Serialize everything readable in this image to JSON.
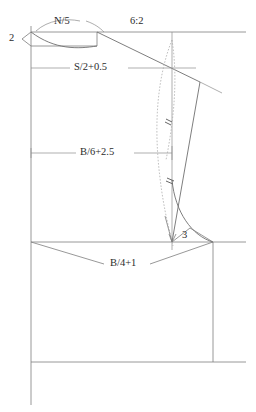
{
  "drawing": {
    "title": "Bodice block pattern draft",
    "type": "technical-line-drawing",
    "colors": {
      "background": "#ffffff",
      "line": "#6b6b6b",
      "construction_line": "#9a9a9a",
      "dashed_curve": "#a8a8a8",
      "text": "#2b2b2b"
    },
    "labels": [
      {
        "id": "neck-width",
        "text": "N/5",
        "x": 54,
        "y": 16,
        "name": "neck-width-label"
      },
      {
        "id": "shoulder-slope",
        "text": "6:2",
        "x": 130,
        "y": 16,
        "name": "shoulder-slope-ratio-label"
      },
      {
        "id": "neck-drop",
        "text": "2",
        "x": 9,
        "y": 33,
        "name": "neck-drop-label"
      },
      {
        "id": "shoulder-width",
        "text": "S/2+0.5",
        "x": 74,
        "y": 62,
        "name": "shoulder-width-label"
      },
      {
        "id": "armhole-depth",
        "text": "B/6+2.5",
        "x": 80,
        "y": 147,
        "name": "armhole-depth-label"
      },
      {
        "id": "underarm",
        "text": "3",
        "x": 182,
        "y": 230,
        "name": "underarm-notch-label"
      },
      {
        "id": "chest-width",
        "text": "B/4+1",
        "x": 110,
        "y": 258,
        "name": "chest-width-label"
      }
    ],
    "construction_lines": {
      "top_horizontal": {
        "x1": 31,
        "y1": 32,
        "x2": 246,
        "y2": 32
      },
      "center_back_vertical": {
        "x1": 31,
        "y1": 25,
        "x2": 31,
        "y2": 405
      },
      "neck_base": {
        "x1": 31,
        "y1": 46,
        "x2": 118,
        "y2": 46
      },
      "shoulder_level": {
        "x1": 31,
        "y1": 68,
        "x2": 196,
        "y2": 68
      },
      "armhole_level": {
        "x1": 31,
        "y1": 153,
        "x2": 172,
        "y2": 153
      },
      "bust_line": {
        "x1": 31,
        "y1": 242,
        "x2": 246,
        "y2": 242
      },
      "hem_line": {
        "x1": 31,
        "y1": 362,
        "x2": 246,
        "y2": 362
      },
      "side_seam": {
        "x1": 213,
        "y1": 242,
        "x2": 213,
        "y2": 362
      },
      "armhole_guide": {
        "x1": 172,
        "y1": 32,
        "x2": 172,
        "y2": 250
      }
    },
    "measurements": {
      "neck_width_formula": "N/5",
      "neck_drop_value": "2",
      "shoulder_slope_ratio": "6:2",
      "shoulder_width_formula": "S/2+0.5",
      "armhole_depth_formula": "B/6+2.5",
      "underarm_value": "3",
      "chest_width_formula": "B/4+1"
    }
  }
}
